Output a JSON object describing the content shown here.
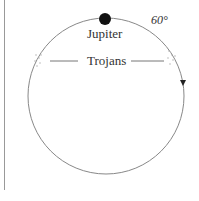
{
  "diagram": {
    "planet_label": "Jupiter",
    "group_label": "Trojans",
    "angle_label": "60°"
  }
}
